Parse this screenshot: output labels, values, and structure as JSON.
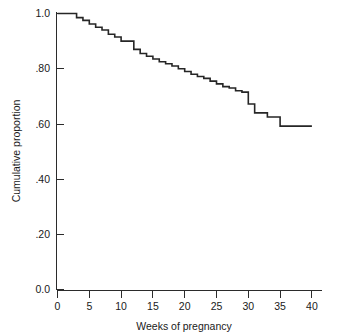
{
  "chart_data": {
    "type": "line",
    "subtype": "step-kaplan-meier",
    "title": "",
    "xlabel": "Weeks of pregnancy",
    "ylabel": "Cumulative proportion",
    "xlim": [
      0,
      42
    ],
    "ylim": [
      0.0,
      1.0
    ],
    "grid": false,
    "legend": null,
    "xticks": [
      0,
      5,
      10,
      15,
      20,
      25,
      30,
      35,
      40
    ],
    "xticklabels": [
      "0",
      "5",
      "10",
      "15",
      "20",
      "25",
      "30",
      "35",
      "40"
    ],
    "yticks": [
      0.0,
      0.2,
      0.4,
      0.6,
      0.8,
      1.0
    ],
    "yticklabels": [
      "0.0",
      ".20",
      ".40",
      ".60",
      ".80",
      "1.0"
    ],
    "series": [
      {
        "name": "Cumulative proportion still pregnant",
        "x": [
          0,
          2,
          3,
          4,
          5,
          6,
          7,
          8,
          9,
          10,
          11,
          12,
          13,
          14,
          15,
          16,
          17,
          18,
          19,
          20,
          21,
          22,
          23,
          24,
          25,
          26,
          27,
          28,
          29,
          30,
          31,
          33,
          35,
          40
        ],
        "values": [
          1.0,
          1.0,
          0.985,
          0.975,
          0.962,
          0.95,
          0.94,
          0.925,
          0.915,
          0.9,
          0.9,
          0.87,
          0.855,
          0.845,
          0.835,
          0.825,
          0.818,
          0.81,
          0.8,
          0.79,
          0.78,
          0.772,
          0.765,
          0.755,
          0.745,
          0.735,
          0.73,
          0.72,
          0.715,
          0.672,
          0.64,
          0.625,
          0.592,
          0.592
        ],
        "line_color": "#262626"
      }
    ]
  },
  "axes": {
    "y_title": "Cumulative proportion",
    "x_title": "Weeks of pregnancy"
  },
  "colors": {
    "line": "#262626",
    "axis": "#2b2b2b",
    "background": "#ffffff",
    "text": "#1a1a1a"
  }
}
